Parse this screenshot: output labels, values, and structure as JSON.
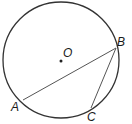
{
  "diagram": {
    "type": "circle-geometry",
    "circle": {
      "center_label": "O",
      "cx": 61,
      "cy": 60,
      "r": 58
    },
    "points": [
      {
        "label": "A",
        "x": 23,
        "y": 100
      },
      {
        "label": "B",
        "x": 116,
        "y": 48
      },
      {
        "label": "C",
        "x": 91,
        "y": 108
      }
    ],
    "segments": [
      [
        "A",
        "B"
      ],
      [
        "B",
        "C"
      ]
    ],
    "colors": {
      "stroke": "#333333",
      "chord": "#555555"
    }
  },
  "labels": {
    "O": "O",
    "A": "A",
    "B": "B",
    "C": "C"
  }
}
